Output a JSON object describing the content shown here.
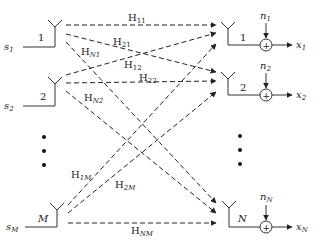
{
  "colors": {
    "line": "#2a2a2a",
    "background": "#ffffff"
  },
  "transmitters": [
    {
      "id": "1",
      "signal": "s",
      "signal_sub": "1",
      "antenna_label": "1"
    },
    {
      "id": "2",
      "signal": "s",
      "signal_sub": "2",
      "antenna_label": "2"
    },
    {
      "id": "M",
      "signal": "s",
      "signal_sub": "M",
      "antenna_label": "M"
    }
  ],
  "receivers": [
    {
      "id": "1",
      "antenna_label": "1",
      "noise": "n",
      "noise_sub": "1",
      "output": "x",
      "output_sub": "1",
      "adder": "+"
    },
    {
      "id": "2",
      "antenna_label": "2",
      "noise": "n",
      "noise_sub": "2",
      "output": "x",
      "output_sub": "2",
      "adder": "+"
    },
    {
      "id": "N",
      "antenna_label": "N",
      "noise": "n",
      "noise_sub": "N",
      "output": "x",
      "output_sub": "N",
      "adder": "+"
    }
  ],
  "channels": [
    {
      "name": "H",
      "sub": "11"
    },
    {
      "name": "H",
      "sub": "21"
    },
    {
      "name": "H",
      "sub": "N1"
    },
    {
      "name": "H",
      "sub": "12"
    },
    {
      "name": "H",
      "sub": "22"
    },
    {
      "name": "H",
      "sub": "N2"
    },
    {
      "name": "H",
      "sub": "1M"
    },
    {
      "name": "H",
      "sub": "2M"
    },
    {
      "name": "H",
      "sub": "NM"
    }
  ],
  "ellipsis": "⋮"
}
